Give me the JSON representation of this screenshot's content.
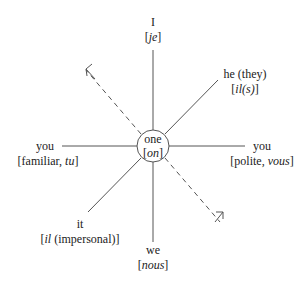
{
  "diagram": {
    "center": {
      "label": "one",
      "french": "on"
    },
    "nodes": [
      {
        "id": "top",
        "label": "I",
        "french_pre": "[",
        "french": "je",
        "french_post": "]"
      },
      {
        "id": "top-right",
        "label": "he (they)",
        "french_pre": "[",
        "french": "il(s)",
        "french_post": "]"
      },
      {
        "id": "right",
        "label": "you",
        "french_pre": "[polite, ",
        "french": "vous",
        "french_post": "]"
      },
      {
        "id": "left",
        "label": "you",
        "french_pre": "[familiar, ",
        "french": "tu",
        "french_post": "]"
      },
      {
        "id": "bottom-left",
        "label": "it",
        "french_pre": "[",
        "french": "il",
        "french_post": " (impersonal)]"
      },
      {
        "id": "bottom",
        "label": "we",
        "french_pre": "[",
        "french": "nous",
        "french_post": "]"
      }
    ],
    "dashed_arrows": [
      "up-left",
      "down-right"
    ],
    "colors": {
      "line": "#555555",
      "text": "#222222"
    }
  }
}
